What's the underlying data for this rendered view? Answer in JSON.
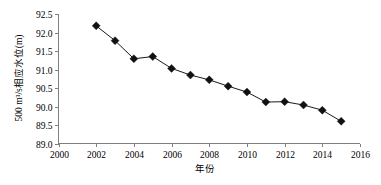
{
  "chart_data": {
    "type": "line",
    "title": "",
    "xlabel": "年份",
    "ylabel": "500 m³/s相应水位(m)",
    "x": [
      2002,
      2003,
      2004,
      2005,
      2006,
      2007,
      2008,
      2009,
      2010,
      2011,
      2012,
      2013,
      2014,
      2015
    ],
    "values": [
      92.18,
      91.78,
      91.29,
      91.35,
      91.03,
      90.85,
      90.72,
      90.55,
      90.39,
      90.12,
      90.13,
      90.04,
      89.9,
      89.6
    ],
    "series": [
      {
        "name": "500 m³/s相应水位",
        "values": [
          92.18,
          91.78,
          91.29,
          91.35,
          91.03,
          90.85,
          90.72,
          90.55,
          90.39,
          90.12,
          90.13,
          90.04,
          89.9,
          89.6
        ]
      }
    ],
    "xlim": [
      2000,
      2016
    ],
    "ylim": [
      89.0,
      92.5
    ],
    "xticks": [
      2000,
      2002,
      2004,
      2006,
      2008,
      2010,
      2012,
      2014,
      2016
    ],
    "yticks": [
      89.0,
      89.5,
      90.0,
      90.5,
      91.0,
      91.5,
      92.0,
      92.5
    ],
    "xtick_labels": [
      "2000",
      "2002",
      "2004",
      "2006",
      "2008",
      "2010",
      "2012",
      "2014",
      "2016"
    ],
    "ytick_labels": [
      "89.0",
      "89.5",
      "90.0",
      "90.5",
      "91.0",
      "91.5",
      "92.0",
      "92.5"
    ],
    "grid": false,
    "legend": false,
    "marker": "diamond",
    "marker_color": "#111111",
    "line_color": "#1a1a1a",
    "axis_color": "#7f7f7f"
  }
}
